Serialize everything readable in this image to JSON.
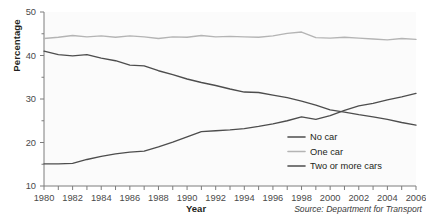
{
  "chart_data": {
    "type": "line",
    "title": "",
    "xlabel": "Year",
    "ylabel": "Percentage",
    "source": "Source: Department for Transport",
    "xlim": [
      1980,
      2006
    ],
    "ylim": [
      10,
      50
    ],
    "ytick_labels": [
      "10",
      "20",
      "30",
      "40",
      "50"
    ],
    "ytick_values": [
      10,
      20,
      30,
      40,
      50
    ],
    "yminor_values": [
      15,
      25,
      35,
      45
    ],
    "x": [
      1980,
      1981,
      1982,
      1983,
      1984,
      1985,
      1986,
      1987,
      1988,
      1989,
      1990,
      1991,
      1992,
      1993,
      1994,
      1995,
      1996,
      1997,
      1998,
      1999,
      2000,
      2001,
      2002,
      2003,
      2004,
      2005,
      2006
    ],
    "xtick_labels": [
      "1980",
      "1982",
      "1984",
      "1986",
      "1988",
      "1990",
      "1992",
      "1994",
      "1996",
      "1998",
      "2000",
      "2002",
      "2004",
      "2006"
    ],
    "xtick_label_values": [
      1980,
      1982,
      1984,
      1986,
      1988,
      1990,
      1992,
      1994,
      1996,
      1998,
      2000,
      2002,
      2004,
      2006
    ],
    "grid": false,
    "legend_position": "lower-right",
    "series": [
      {
        "name": "No car",
        "color": "#4d4d4d",
        "values": [
          41.0,
          40.2,
          39.9,
          40.2,
          39.4,
          38.8,
          37.8,
          37.6,
          36.5,
          35.6,
          34.6,
          33.8,
          33.1,
          32.3,
          31.6,
          31.5,
          30.9,
          30.3,
          29.5,
          28.6,
          27.5,
          27.0,
          26.4,
          25.9,
          25.3,
          24.6,
          24.0
        ]
      },
      {
        "name": "One car",
        "color": "#b4b4b4",
        "values": [
          43.9,
          44.2,
          44.6,
          44.3,
          44.5,
          44.2,
          44.5,
          44.3,
          43.9,
          44.3,
          44.2,
          44.6,
          44.3,
          44.4,
          44.3,
          44.2,
          44.5,
          45.1,
          45.4,
          44.1,
          44.0,
          44.2,
          44.0,
          43.8,
          43.6,
          43.9,
          43.7
        ]
      },
      {
        "name": "Two or more cars",
        "color": "#4d4d4d",
        "values": [
          15.1,
          15.1,
          15.2,
          16.1,
          16.8,
          17.4,
          17.8,
          18.0,
          19.0,
          20.1,
          21.3,
          22.5,
          22.7,
          22.9,
          23.2,
          23.7,
          24.3,
          25.0,
          25.9,
          25.3,
          26.2,
          27.4,
          28.4,
          29.0,
          29.8,
          30.5,
          31.3
        ]
      }
    ]
  },
  "legend": {
    "items": [
      {
        "label": "No car",
        "color": "#4d4d4d"
      },
      {
        "label": "One car",
        "color": "#b4b4b4"
      },
      {
        "label": "Two or more cars",
        "color": "#4d4d4d"
      }
    ]
  }
}
